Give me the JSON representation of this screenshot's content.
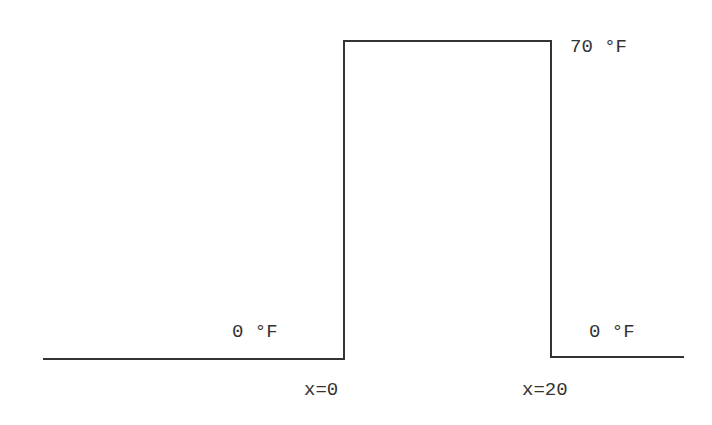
{
  "diagram": {
    "type": "temperature-profile",
    "stroke_color": "#333333",
    "background": "#ffffff",
    "labels": {
      "top_temperature": "70 °F",
      "left_temperature": "0 °F",
      "right_temperature": "0 °F",
      "left_boundary": "x=0",
      "right_boundary": "x=20"
    },
    "profile": {
      "points": [
        {
          "x": 43,
          "y": 359
        },
        {
          "x": 344,
          "y": 359
        },
        {
          "x": 344,
          "y": 41
        },
        {
          "x": 551,
          "y": 41
        },
        {
          "x": 551,
          "y": 357
        },
        {
          "x": 684,
          "y": 357
        }
      ],
      "segments": [
        {
          "name": "left-baseline",
          "x1": 43,
          "y1": 359,
          "x2": 344,
          "y2": 359
        },
        {
          "name": "left-rise",
          "x1": 344,
          "y1": 359,
          "x2": 344,
          "y2": 41
        },
        {
          "name": "top-plateau",
          "x1": 344,
          "y1": 41,
          "x2": 551,
          "y2": 41
        },
        {
          "name": "right-drop",
          "x1": 551,
          "y1": 41,
          "x2": 551,
          "y2": 357
        },
        {
          "name": "right-baseline",
          "x1": 551,
          "y1": 357,
          "x2": 684,
          "y2": 357
        }
      ]
    }
  }
}
